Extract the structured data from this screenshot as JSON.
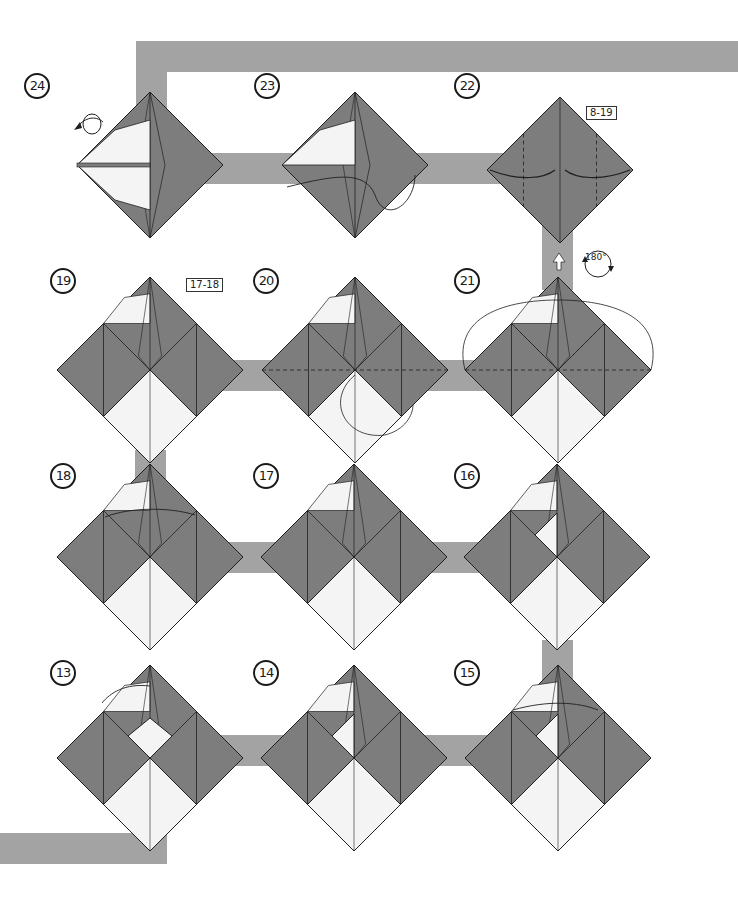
{
  "page": {
    "type": "origami-instruction-diagram",
    "background": "#ffffff",
    "path_color": "#a3a3a3",
    "paper_colored": "#7d7d7d",
    "paper_white": "#f4f4f4",
    "line_color": "#1f1f1f"
  },
  "steps": [
    {
      "number": "24",
      "label_pos": [
        24,
        73
      ],
      "center": [
        150,
        165
      ],
      "size": 73,
      "kind": "final-side",
      "annotation": "turn-over"
    },
    {
      "number": "23",
      "label_pos": [
        254,
        73
      ],
      "center": [
        355,
        165
      ],
      "size": 73,
      "kind": "side"
    },
    {
      "number": "22",
      "label_pos": [
        454,
        73
      ],
      "center": [
        560,
        170
      ],
      "size": 73,
      "kind": "plain",
      "ref": "8-19"
    },
    {
      "number": "19",
      "label_pos": [
        50,
        268
      ],
      "center": [
        150,
        370
      ],
      "size": 93,
      "kind": "base",
      "ref": "17-18"
    },
    {
      "number": "20",
      "label_pos": [
        253,
        268
      ],
      "center": [
        355,
        370
      ],
      "size": 93,
      "kind": "base"
    },
    {
      "number": "21",
      "label_pos": [
        454,
        268
      ],
      "center": [
        558,
        370
      ],
      "size": 93,
      "kind": "base",
      "annotation": "rotate-180"
    },
    {
      "number": "18",
      "label_pos": [
        50,
        463
      ],
      "center": [
        150,
        557
      ],
      "size": 93,
      "kind": "base"
    },
    {
      "number": "17",
      "label_pos": [
        253,
        463
      ],
      "center": [
        354,
        557
      ],
      "size": 93,
      "kind": "base"
    },
    {
      "number": "16",
      "label_pos": [
        454,
        463
      ],
      "center": [
        557,
        557
      ],
      "size": 93,
      "kind": "base"
    },
    {
      "number": "13",
      "label_pos": [
        50,
        660
      ],
      "center": [
        150,
        758
      ],
      "size": 93,
      "kind": "base"
    },
    {
      "number": "14",
      "label_pos": [
        253,
        660
      ],
      "center": [
        354,
        758
      ],
      "size": 93,
      "kind": "base"
    },
    {
      "number": "15",
      "label_pos": [
        454,
        660
      ],
      "center": [
        558,
        758
      ],
      "size": 93,
      "kind": "base"
    }
  ],
  "references": [
    {
      "text": "8-19",
      "pos": [
        586,
        106
      ]
    },
    {
      "text": "17-18",
      "pos": [
        186,
        278
      ]
    }
  ],
  "rotation_symbol": {
    "text": "180°",
    "pos": [
      585,
      252
    ]
  },
  "path_bands": [
    {
      "x": 136,
      "y": 41,
      "w": 602,
      "h": 31
    },
    {
      "x": 136,
      "y": 41,
      "w": 31,
      "h": 142
    },
    {
      "x": 136,
      "y": 153,
      "w": 400,
      "h": 31
    },
    {
      "x": 542,
      "y": 225,
      "w": 31,
      "h": 65
    },
    {
      "x": 200,
      "y": 360,
      "w": 360,
      "h": 31
    },
    {
      "x": 135,
      "y": 450,
      "w": 31,
      "h": 30
    },
    {
      "x": 150,
      "y": 542,
      "w": 400,
      "h": 31
    },
    {
      "x": 542,
      "y": 640,
      "w": 31,
      "h": 40
    },
    {
      "x": 150,
      "y": 735,
      "w": 400,
      "h": 31
    },
    {
      "x": 0,
      "y": 833,
      "w": 167,
      "h": 31
    }
  ]
}
